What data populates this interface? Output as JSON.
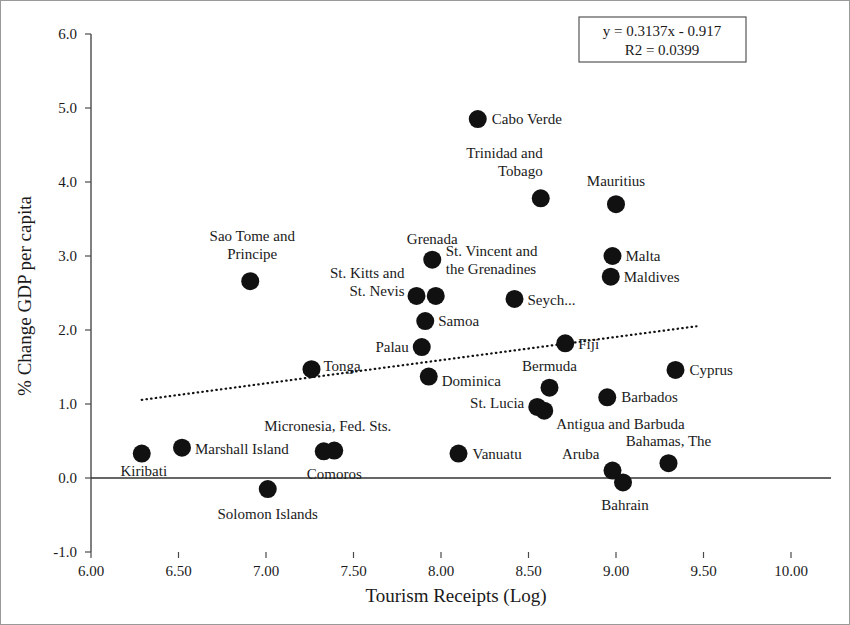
{
  "chart_data": {
    "type": "scatter",
    "title": "",
    "xlabel": "Tourism Receipts (Log)",
    "ylabel": "% Change GDP per capita",
    "xlim": [
      6.0,
      10.0
    ],
    "ylim": [
      -1.0,
      6.0
    ],
    "xticks": [
      "6.00",
      "6.50",
      "7.00",
      "7.50",
      "8.00",
      "8.50",
      "9.00",
      "9.50",
      "10.00"
    ],
    "xtick_values": [
      6.0,
      6.5,
      7.0,
      7.5,
      8.0,
      8.5,
      9.0,
      9.5,
      10.0
    ],
    "yticks": [
      "-1.0",
      "0.0",
      "1.0",
      "2.0",
      "3.0",
      "4.0",
      "5.0",
      "6.0"
    ],
    "ytick_values": [
      -1.0,
      0.0,
      1.0,
      2.0,
      3.0,
      4.0,
      5.0,
      6.0
    ],
    "grid": false,
    "legend": "none",
    "marker_color": "#111111",
    "trendline": {
      "equation": "y = 0.3137x - 0.917",
      "r_squared_text": "R2 = 0.0399",
      "slope": 0.3137,
      "intercept": -0.917,
      "r2": 0.0399,
      "style": "dotted",
      "x_start": 6.29,
      "x_end": 9.46
    },
    "points": [
      {
        "name": "Cabo Verde",
        "x": 8.21,
        "y": 4.85,
        "label_dx": 14,
        "label_dy": 5,
        "anchor": "start",
        "lines": [
          "Cabo Verde"
        ]
      },
      {
        "name": "Trinidad and Tobago",
        "x": 8.57,
        "y": 3.78,
        "label_dx": 2,
        "label_dy": -40,
        "anchor": "end",
        "lines": [
          "Trinidad and",
          "Tobago"
        ]
      },
      {
        "name": "Mauritius",
        "x": 9.0,
        "y": 3.7,
        "label_dx": 0,
        "label_dy": -18,
        "anchor": "middle",
        "lines": [
          "Mauritius"
        ]
      },
      {
        "name": "Malta",
        "x": 8.98,
        "y": 3.0,
        "label_dx": 13,
        "label_dy": 5,
        "anchor": "start",
        "lines": [
          "Malta"
        ]
      },
      {
        "name": "Grenada",
        "x": 7.95,
        "y": 2.95,
        "label_dx": 0,
        "label_dy": -16,
        "anchor": "middle",
        "lines": [
          "Grenada"
        ]
      },
      {
        "name": "Maldives",
        "x": 8.97,
        "y": 2.72,
        "label_dx": 13,
        "label_dy": 5,
        "anchor": "start",
        "lines": [
          "Maldives"
        ]
      },
      {
        "name": "Sao Tome and Principe",
        "x": 6.91,
        "y": 2.66,
        "label_dx": 2,
        "label_dy": -40,
        "anchor": "middle",
        "lines": [
          "Sao Tome and",
          "Principe"
        ]
      },
      {
        "name": "St. Kitts and St. Nevis",
        "x": 7.86,
        "y": 2.46,
        "label_dx": -12,
        "label_dy": -18,
        "anchor": "end",
        "lines": [
          "St. Kitts and",
          "St. Nevis"
        ]
      },
      {
        "name": "St. Vincent and the Grenadines",
        "x": 7.97,
        "y": 2.46,
        "label_dx": 10,
        "label_dy": -40,
        "anchor": "start",
        "lines": [
          "St. Vincent and",
          "the Grenadines"
        ]
      },
      {
        "name": "Seychelles",
        "x": 8.42,
        "y": 2.42,
        "label_dx": 13,
        "label_dy": 6,
        "anchor": "start",
        "lines": [
          "Seych..."
        ]
      },
      {
        "name": "Samoa",
        "x": 7.91,
        "y": 2.12,
        "label_dx": 13,
        "label_dy": 5,
        "anchor": "start",
        "lines": [
          "Samoa"
        ]
      },
      {
        "name": "Fiji",
        "x": 8.71,
        "y": 1.82,
        "label_dx": 13,
        "label_dy": 6,
        "anchor": "start",
        "lines": [
          "Fiji"
        ]
      },
      {
        "name": "Palau",
        "x": 7.89,
        "y": 1.77,
        "label_dx": -13,
        "label_dy": 5,
        "anchor": "end",
        "lines": [
          "Palau"
        ]
      },
      {
        "name": "Tonga",
        "x": 7.26,
        "y": 1.47,
        "label_dx": 12,
        "label_dy": 2,
        "anchor": "start",
        "lines": [
          "Tonga"
        ]
      },
      {
        "name": "Cyprus",
        "x": 9.34,
        "y": 1.46,
        "label_dx": 14,
        "label_dy": 5,
        "anchor": "start",
        "lines": [
          "Cyprus"
        ]
      },
      {
        "name": "Dominica",
        "x": 7.93,
        "y": 1.37,
        "label_dx": 13,
        "label_dy": 9,
        "anchor": "start",
        "lines": [
          "Dominica"
        ]
      },
      {
        "name": "Bermuda",
        "x": 8.62,
        "y": 1.22,
        "label_dx": 0,
        "label_dy": -17,
        "anchor": "middle",
        "lines": [
          "Bermuda"
        ]
      },
      {
        "name": "Barbados",
        "x": 8.95,
        "y": 1.09,
        "label_dx": 14,
        "label_dy": 5,
        "anchor": "start",
        "lines": [
          "Barbados"
        ]
      },
      {
        "name": "St. Lucia",
        "x": 8.55,
        "y": 0.96,
        "label_dx": -13,
        "label_dy": 1,
        "anchor": "end",
        "lines": [
          "St. Lucia"
        ]
      },
      {
        "name": "Antigua and Barbuda",
        "x": 8.59,
        "y": 0.91,
        "label_dx": 12,
        "label_dy": 18,
        "anchor": "start",
        "lines": [
          "Antigua and Barbuda"
        ]
      },
      {
        "name": "Micronesia, Fed. Sts.",
        "x": 7.33,
        "y": 0.36,
        "label_dx": 4,
        "label_dy": -20,
        "anchor": "middle",
        "lines": [
          "Micronesia, Fed. Sts."
        ]
      },
      {
        "name": "Comoros",
        "x": 7.39,
        "y": 0.37,
        "label_dx": 0,
        "label_dy": 28,
        "anchor": "middle",
        "lines": [
          "Comoros"
        ]
      },
      {
        "name": "Marshall Island",
        "x": 6.52,
        "y": 0.41,
        "label_dx": 13,
        "label_dy": 6,
        "anchor": "start",
        "lines": [
          "Marshall Island"
        ]
      },
      {
        "name": "Kiribati",
        "x": 6.29,
        "y": 0.33,
        "label_dx": 2,
        "label_dy": 22,
        "anchor": "middle",
        "lines": [
          "Kiribati"
        ]
      },
      {
        "name": "Vanuatu",
        "x": 8.1,
        "y": 0.33,
        "label_dx": 14,
        "label_dy": 5,
        "anchor": "start",
        "lines": [
          "Vanuatu"
        ]
      },
      {
        "name": "Bahamas, The",
        "x": 9.3,
        "y": 0.2,
        "label_dx": 0,
        "label_dy": -17,
        "anchor": "middle",
        "lines": [
          "Bahamas, The"
        ]
      },
      {
        "name": "Aruba",
        "x": 8.98,
        "y": 0.1,
        "label_dx": -13,
        "label_dy": -12,
        "anchor": "end",
        "lines": [
          "Aruba"
        ]
      },
      {
        "name": "Bahrain",
        "x": 9.04,
        "y": -0.06,
        "label_dx": 2,
        "label_dy": 28,
        "anchor": "middle",
        "lines": [
          "Bahrain"
        ]
      },
      {
        "name": "Solomon Islands",
        "x": 7.01,
        "y": -0.15,
        "label_dx": 0,
        "label_dy": 30,
        "anchor": "middle",
        "lines": [
          "Solomon Islands"
        ]
      }
    ]
  },
  "axes": {
    "x_title": "Tourism Receipts (Log)",
    "y_title": "% Change GDP per capita"
  },
  "equation_box": {
    "line1": "y = 0.3137x - 0.917",
    "line2": "R2 = 0.0399"
  }
}
